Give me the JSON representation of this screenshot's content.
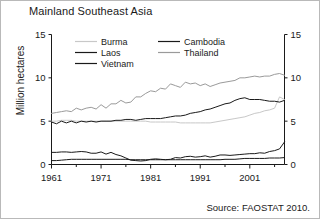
{
  "figure": {
    "title": "Mainland Southeast Asia",
    "source_note": "Source: FAOSTAT 2010.",
    "border_color": "#b9b9b9",
    "background": "#ffffff"
  },
  "axes": {
    "ylabel": "Million hectares",
    "y_ticks": [
      "0",
      "5",
      "10",
      "15"
    ],
    "y_ticks_right": [
      "0",
      "5",
      "10",
      "15"
    ],
    "x_ticks": [
      "1961",
      "1971",
      "1981",
      "1991",
      "2001"
    ]
  },
  "legend": {
    "entries": [
      {
        "label": "Burma",
        "color": "#c8c8c8"
      },
      {
        "label": "Cambodia",
        "color": "#1a1a1a"
      },
      {
        "label": "Laos",
        "color": "#1a1a1a"
      },
      {
        "label": "Thailand",
        "color": "#9a9a9a"
      },
      {
        "label": "Vietnam",
        "color": "#1a1a1a"
      }
    ]
  },
  "chart_data": {
    "type": "line",
    "title": "Mainland Southeast Asia",
    "subtitle": "",
    "xlabel": "",
    "ylabel": "Million hectares",
    "xlim": [
      1961,
      2008
    ],
    "ylim": [
      0,
      15
    ],
    "grid": false,
    "legend_position": "top-inside",
    "annotations": [
      "Source: FAOSTAT 2010."
    ],
    "x": [
      1961,
      1962,
      1963,
      1964,
      1965,
      1966,
      1967,
      1968,
      1969,
      1970,
      1971,
      1972,
      1973,
      1974,
      1975,
      1976,
      1977,
      1978,
      1979,
      1980,
      1981,
      1982,
      1983,
      1984,
      1985,
      1986,
      1987,
      1988,
      1989,
      1990,
      1991,
      1992,
      1993,
      1994,
      1995,
      1996,
      1997,
      1998,
      1999,
      2000,
      2001,
      2002,
      2003,
      2004,
      2005,
      2006,
      2007,
      2008
    ],
    "series": [
      {
        "name": "Thailand",
        "color": "#9a9a9a",
        "values": [
          5.9,
          6.0,
          6.1,
          6.2,
          6.1,
          6.5,
          6.3,
          6.5,
          6.6,
          6.4,
          6.9,
          6.5,
          7.0,
          7.0,
          7.4,
          7.1,
          7.2,
          7.8,
          7.8,
          8.2,
          8.5,
          8.4,
          8.8,
          8.7,
          9.3,
          9.1,
          8.9,
          9.5,
          9.3,
          9.4,
          9.1,
          9.3,
          9.0,
          9.2,
          9.4,
          9.5,
          9.6,
          9.7,
          10.0,
          10.0,
          10.1,
          10.2,
          10.1,
          10.2,
          10.2,
          10.4,
          10.5,
          10.3
        ]
      },
      {
        "name": "Vietnam",
        "color": "#1a1a1a",
        "values": [
          4.9,
          4.7,
          5.0,
          4.8,
          5.0,
          4.8,
          5.0,
          4.9,
          5.0,
          4.9,
          5.0,
          5.0,
          5.0,
          5.1,
          5.1,
          5.2,
          5.2,
          5.1,
          5.2,
          5.3,
          5.3,
          5.3,
          5.3,
          5.4,
          5.5,
          5.6,
          5.6,
          5.7,
          5.9,
          6.0,
          6.1,
          6.3,
          6.4,
          6.6,
          6.8,
          7.0,
          7.1,
          7.4,
          7.6,
          7.7,
          7.5,
          7.5,
          7.5,
          7.4,
          7.3,
          7.3,
          7.2,
          7.4
        ]
      },
      {
        "name": "Burma",
        "color": "#c8c8c8",
        "values": [
          5.0,
          5.0,
          5.1,
          5.1,
          5.1,
          5.0,
          5.0,
          5.0,
          5.0,
          5.0,
          5.0,
          5.0,
          5.0,
          5.0,
          5.0,
          5.0,
          5.0,
          5.0,
          5.0,
          5.0,
          4.9,
          4.9,
          4.9,
          4.9,
          4.9,
          4.9,
          4.8,
          4.8,
          4.8,
          4.8,
          4.8,
          4.8,
          4.8,
          4.9,
          5.0,
          5.1,
          5.2,
          5.3,
          5.4,
          5.5,
          5.7,
          5.9,
          6.0,
          6.2,
          6.3,
          6.5,
          7.8,
          7.5
        ]
      },
      {
        "name": "Cambodia",
        "color": "#1a1a1a",
        "values": [
          1.4,
          1.4,
          1.45,
          1.45,
          1.4,
          1.45,
          1.5,
          1.45,
          1.3,
          1.3,
          1.45,
          1.2,
          1.4,
          1.15,
          1.0,
          0.75,
          0.5,
          0.45,
          0.4,
          0.45,
          0.6,
          0.65,
          0.6,
          0.55,
          0.6,
          0.8,
          0.75,
          0.9,
          0.95,
          0.85,
          0.9,
          1.0,
          0.85,
          0.95,
          1.1,
          1.1,
          1.05,
          1.1,
          1.15,
          1.2,
          1.25,
          1.25,
          1.35,
          1.3,
          1.5,
          1.6,
          1.8,
          2.6
        ]
      },
      {
        "name": "Laos",
        "color": "#1a1a1a",
        "values": [
          0.45,
          0.45,
          0.5,
          0.55,
          0.6,
          0.6,
          0.6,
          0.6,
          0.6,
          0.6,
          0.6,
          0.6,
          0.6,
          0.6,
          0.6,
          0.6,
          0.55,
          0.55,
          0.55,
          0.55,
          0.55,
          0.55,
          0.55,
          0.55,
          0.55,
          0.55,
          0.55,
          0.55,
          0.55,
          0.55,
          0.55,
          0.55,
          0.55,
          0.55,
          0.55,
          0.6,
          0.6,
          0.6,
          0.65,
          0.7,
          0.7,
          0.7,
          0.7,
          0.7,
          0.75,
          0.75,
          0.75,
          0.8
        ]
      }
    ]
  }
}
